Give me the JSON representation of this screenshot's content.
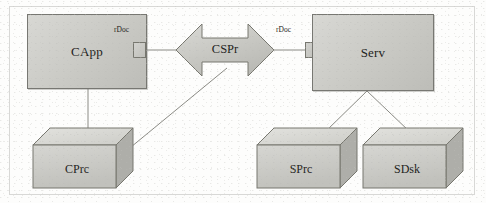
{
  "diagram": {
    "background_color": "#fdfdfc",
    "node_fill": "#cfcfca",
    "node_stroke": "#777772",
    "edge_color": "#8a8a84",
    "nodes": {
      "client_app": {
        "label": "CApp",
        "shape": "rectangle"
      },
      "client_process": {
        "label": "CPrc",
        "shape": "cuboid"
      },
      "server": {
        "label": "Serv",
        "shape": "rectangle"
      },
      "server_process": {
        "label": "SPrc",
        "shape": "cuboid"
      },
      "server_disk": {
        "label": "SDsk",
        "shape": "cuboid"
      }
    },
    "connector": {
      "label": "CSPr",
      "shape": "double-headed-arrow"
    },
    "ports": {
      "client_port_label": "rDoc",
      "server_port_label": "rDoc"
    },
    "edges": [
      {
        "from": "CApp",
        "to": "CPrc"
      },
      {
        "from": "CApp",
        "to": "CSPr"
      },
      {
        "from": "CPrc",
        "to": "CSPr"
      },
      {
        "from": "CSPr",
        "to": "Serv"
      },
      {
        "from": "Serv",
        "to": "SPrc"
      },
      {
        "from": "Serv",
        "to": "SDsk"
      }
    ]
  }
}
